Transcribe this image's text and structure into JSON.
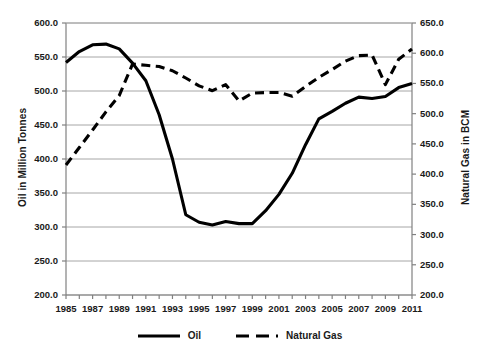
{
  "chart_data": {
    "type": "line",
    "title": "",
    "xlabel": "",
    "ylabel": "Oil in Million Tonnes",
    "y2label": "Natural Gas in BCM",
    "grid": true,
    "legend_position": "bottom",
    "x": [
      1985,
      1986,
      1987,
      1988,
      1989,
      1990,
      1991,
      1992,
      1993,
      1994,
      1995,
      1996,
      1997,
      1998,
      1999,
      2000,
      2001,
      2002,
      2003,
      2004,
      2005,
      2006,
      2007,
      2008,
      2009,
      2010,
      2011
    ],
    "xlim": [
      1985,
      2011
    ],
    "xtick_labels": [
      "1985",
      "1987",
      "1989",
      "1991",
      "1993",
      "1995",
      "1997",
      "1999",
      "2001",
      "2003",
      "2005",
      "2007",
      "2009",
      "2011"
    ],
    "xtick_values": [
      1985,
      1987,
      1989,
      1991,
      1993,
      1995,
      1997,
      1999,
      2001,
      2003,
      2005,
      2007,
      2009,
      2011
    ],
    "ylim": [
      200.0,
      600.0
    ],
    "ytick_labels": [
      "200.0",
      "250.0",
      "300.0",
      "350.0",
      "400.0",
      "450.0",
      "500.0",
      "550.0",
      "600.0"
    ],
    "ytick_values": [
      200.0,
      250.0,
      300.0,
      350.0,
      400.0,
      450.0,
      500.0,
      550.0,
      600.0
    ],
    "y2lim": [
      200.0,
      650.0
    ],
    "y2tick_labels": [
      "200.0",
      "250.0",
      "300.0",
      "350.0",
      "400.0",
      "450.0",
      "500.0",
      "550.0",
      "600.0",
      "650.0"
    ],
    "y2tick_values": [
      200.0,
      250.0,
      300.0,
      350.0,
      400.0,
      450.0,
      500.0,
      550.0,
      600.0,
      650.0
    ],
    "series": [
      {
        "name": "Oil",
        "axis": "left",
        "style": "solid",
        "color": "#000000",
        "unit": "Million Tonnes",
        "values": [
          542,
          558,
          568,
          569,
          562,
          541,
          515,
          465,
          400,
          318,
          307,
          303,
          308,
          305,
          305,
          324,
          348,
          379,
          421,
          459,
          470,
          482,
          491,
          489,
          492,
          505,
          511
        ]
      },
      {
        "name": "Natural Gas",
        "axis": "right",
        "style": "dashed",
        "color": "#000000",
        "unit": "BCM",
        "values": [
          415,
          444,
          473,
          503,
          530,
          582,
          580,
          578,
          571,
          559,
          546,
          538,
          548,
          521,
          534,
          535,
          535,
          529,
          545,
          560,
          573,
          587,
          596,
          597,
          548,
          590,
          607
        ]
      }
    ]
  }
}
